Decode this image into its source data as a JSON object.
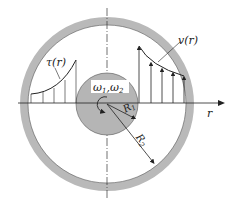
{
  "diagram": {
    "labels": {
      "shear": "τ(r)",
      "velocity": "v(r)",
      "omegas": "ω1,ω2",
      "omega1": "ω",
      "omega1_sub": "1",
      "omega2": "ω",
      "omega2_sub": "2",
      "inner_radius": "R",
      "inner_radius_sub": "1",
      "outer_radius": "R",
      "outer_radius_sub": "2",
      "axis": "r"
    },
    "colors": {
      "ring": "#b9b9b9",
      "inner_cylinder": "#b5b5b5",
      "line": "#222222",
      "background": "#ffffff"
    },
    "geometry": {
      "center": [
        107,
        104
      ],
      "outer_ring_outer_radius": 87,
      "outer_ring_inner_radius": 79,
      "inner_cylinder_radius": 31
    }
  }
}
